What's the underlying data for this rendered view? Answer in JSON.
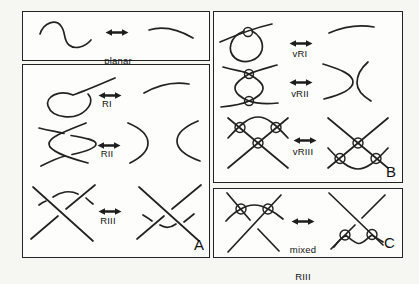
{
  "panels": {
    "isotopy": {
      "label": [
        "planar",
        "isotopy"
      ]
    },
    "a": {
      "corner": "A",
      "moves": [
        "RI",
        "RII",
        "RIII"
      ]
    },
    "b": {
      "corner": "B",
      "moves": [
        "vRI",
        "vRII",
        "vRIII"
      ]
    },
    "c": {
      "corner": "C",
      "label": [
        "mixed",
        "RIII"
      ]
    }
  },
  "icons": {
    "double_arrow": "left-right-double-arrow"
  },
  "colors": {
    "ink": "#222222",
    "paper": "#f6f6f3",
    "panel_background": "#fdfdfb"
  }
}
